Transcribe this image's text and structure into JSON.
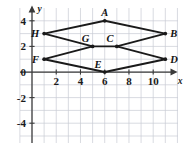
{
  "figure": {
    "name": "coordinate-plane-geometry-figure",
    "background_color": "#ffffff",
    "grid_color": "#c8ccd4",
    "axis_color": "#3a3a3a",
    "shape_color": "#1a1a1a",
    "label_color": "#111111"
  },
  "chart_data": {
    "type": "scatter",
    "title": "",
    "xlabel": "x",
    "ylabel": "y",
    "xlim": [
      -1,
      12.3
    ],
    "ylim": [
      -5.2,
      4.6
    ],
    "xticks": [
      2,
      4,
      6,
      8,
      10
    ],
    "yticks": [
      4,
      2,
      0,
      -2,
      -4
    ],
    "xtick_labels": [
      "2",
      "4",
      "6",
      "8",
      "10"
    ],
    "ytick_labels": [
      "4",
      "2",
      "0",
      "-2",
      "-4"
    ],
    "grid": true,
    "grid_step": 1,
    "legend": "none",
    "points": [
      {
        "id": "A",
        "label": "A",
        "x": 6,
        "y": 4,
        "label_pos": "above"
      },
      {
        "id": "B",
        "label": "B",
        "x": 11,
        "y": 3,
        "label_pos": "right"
      },
      {
        "id": "C",
        "label": "C",
        "x": 7,
        "y": 2,
        "label_pos": "above-left"
      },
      {
        "id": "D",
        "label": "D",
        "x": 11,
        "y": 1,
        "label_pos": "right"
      },
      {
        "id": "E",
        "label": "E",
        "x": 6,
        "y": 0,
        "label_pos": "above-left"
      },
      {
        "id": "F",
        "label": "F",
        "x": 1,
        "y": 1,
        "label_pos": "left"
      },
      {
        "id": "G",
        "label": "G",
        "x": 5,
        "y": 2,
        "label_pos": "above-left"
      },
      {
        "id": "H",
        "label": "H",
        "x": 1,
        "y": 3,
        "label_pos": "left"
      }
    ],
    "segments": [
      {
        "name": "H-A",
        "from": "H",
        "to": "A"
      },
      {
        "name": "A-B",
        "from": "A",
        "to": "B"
      },
      {
        "name": "B-C",
        "from": "B",
        "to": "C"
      },
      {
        "name": "C-G",
        "from": "C",
        "to": "G"
      },
      {
        "name": "G-H",
        "from": "G",
        "to": "H"
      },
      {
        "name": "F-G",
        "from": "F",
        "to": "G"
      },
      {
        "name": "C-D",
        "from": "C",
        "to": "D"
      },
      {
        "name": "D-E",
        "from": "D",
        "to": "E"
      },
      {
        "name": "E-F",
        "from": "E",
        "to": "F"
      }
    ],
    "axis_arrows": {
      "x_positive": true,
      "y_positive": true
    }
  }
}
